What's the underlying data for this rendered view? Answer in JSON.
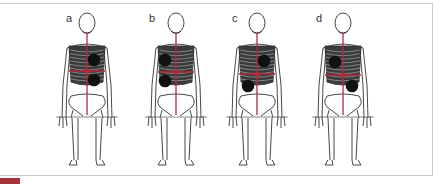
{
  "figure": {
    "panels": [
      {
        "label": "a",
        "label_x": 66,
        "label_y": 12,
        "cx": 87,
        "spots": [
          [
            94,
            60
          ],
          [
            94,
            80
          ]
        ],
        "cross_y": 71
      },
      {
        "label": "b",
        "label_x": 149,
        "label_y": 12,
        "cx": 176,
        "spots": [
          [
            165,
            60
          ],
          [
            165,
            81
          ]
        ],
        "cross_y": 72
      },
      {
        "label": "c",
        "label_x": 232,
        "label_y": 12,
        "cx": 257,
        "spots": [
          [
            264,
            61
          ],
          [
            248,
            86
          ]
        ],
        "cross_y": 74
      },
      {
        "label": "d",
        "label_x": 316,
        "label_y": 12,
        "cx": 343,
        "spots": [
          [
            335,
            62
          ],
          [
            352,
            86
          ]
        ],
        "cross_y": 75
      }
    ],
    "colors": {
      "accent": "#b5283c",
      "frame": "#cfc6c8",
      "tab": "#a8323c",
      "spot": "#111111",
      "bone": "#333333"
    }
  }
}
